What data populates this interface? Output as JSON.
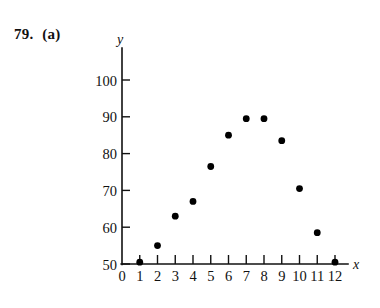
{
  "problem": {
    "number": "79.",
    "part": "(a)"
  },
  "chart_data": {
    "type": "scatter",
    "title": "",
    "xlabel": "x",
    "ylabel": "y",
    "xlim": [
      0,
      12
    ],
    "ylim": [
      50,
      100
    ],
    "grid": false,
    "legend": false,
    "x_ticks": [
      0,
      1,
      2,
      3,
      4,
      5,
      6,
      7,
      8,
      9,
      10,
      11,
      12
    ],
    "x_tick_labels": [
      "0",
      "1",
      "2",
      "3",
      "4",
      "5",
      "6",
      "7",
      "8",
      "9",
      "10",
      "11",
      "12"
    ],
    "y_ticks": [
      50,
      60,
      70,
      80,
      90,
      100
    ],
    "y_tick_labels": [
      "50",
      "60",
      "70",
      "80",
      "90",
      "100"
    ],
    "x": [
      1,
      2,
      3,
      4,
      5,
      6,
      7,
      8,
      9,
      10,
      11,
      12
    ],
    "values": [
      50.5,
      55,
      63,
      67,
      76.5,
      85,
      89.5,
      89.5,
      83.5,
      70.5,
      58.5,
      50.5
    ],
    "points": [
      {
        "x": 1,
        "y": 50.5
      },
      {
        "x": 2,
        "y": 55
      },
      {
        "x": 3,
        "y": 63
      },
      {
        "x": 4,
        "y": 67
      },
      {
        "x": 5,
        "y": 76.5
      },
      {
        "x": 6,
        "y": 85
      },
      {
        "x": 7,
        "y": 89.5
      },
      {
        "x": 8,
        "y": 89.5
      },
      {
        "x": 9,
        "y": 83.5
      },
      {
        "x": 10,
        "y": 70.5
      },
      {
        "x": 11,
        "y": 58.5
      },
      {
        "x": 12,
        "y": 50.5
      }
    ],
    "marker": "filled-circle",
    "marker_color": "#000000",
    "axis_color": "#111111"
  }
}
